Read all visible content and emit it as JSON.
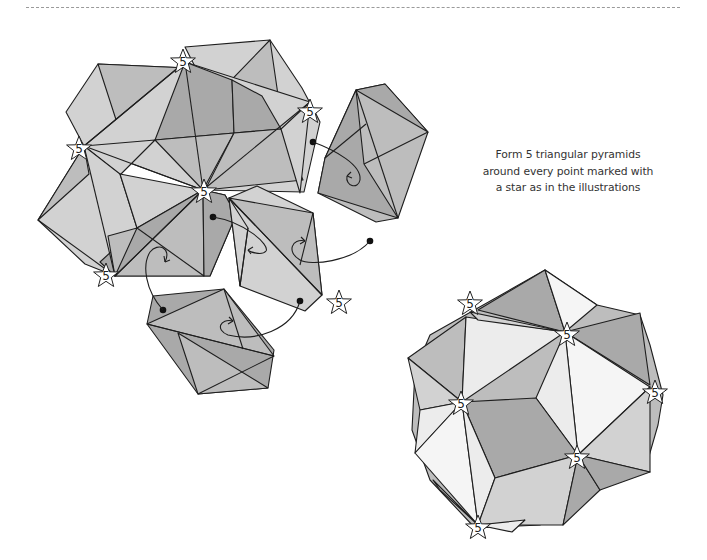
{
  "page": {
    "cut_line": {
      "style": "dashed",
      "color": "#9a9a9a"
    },
    "instruction": {
      "lines": [
        "Form 5 triangular pyramids",
        "around every point marked with",
        "a star as in the illustrations"
      ]
    },
    "colors": {
      "light": "#d2d2d2",
      "medium": "#bdbdbd",
      "dark": "#a9a9a9",
      "pale": "#ececec",
      "line": "#1e1e1e"
    }
  },
  "figures": {
    "assembly_step": {
      "description": "Partially assembled modules with arrows showing insertion",
      "stars": [
        {
          "label": "5"
        },
        {
          "label": "5"
        },
        {
          "label": "5"
        },
        {
          "label": "5"
        },
        {
          "label": "5"
        },
        {
          "label": "5"
        }
      ]
    },
    "finished_model": {
      "description": "Completed modular origami ball",
      "stars": [
        {
          "label": "5"
        },
        {
          "label": "5"
        },
        {
          "label": "5"
        },
        {
          "label": "5"
        },
        {
          "label": "5"
        },
        {
          "label": "5"
        }
      ]
    }
  }
}
